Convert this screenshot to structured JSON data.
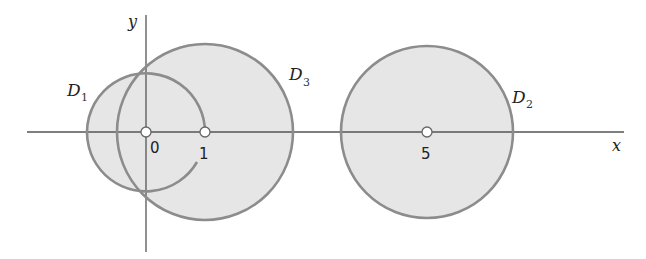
{
  "figure": {
    "axes": {
      "x_label": "x",
      "y_label": "y",
      "stroke_color": "#555555"
    },
    "regions": [
      {
        "id": "D1",
        "label_main": "D",
        "label_sub": "1",
        "center": 0,
        "radius": 1,
        "boundary": "open arc (partial circle)"
      },
      {
        "id": "D3",
        "label_main": "D",
        "label_sub": "3",
        "center": 1,
        "radius": 1.5,
        "boundary": "full circle"
      },
      {
        "id": "D2",
        "label_main": "D",
        "label_sub": "2",
        "center": 5,
        "radius": 1.5,
        "boundary": "full circle"
      }
    ],
    "points": [
      {
        "label": "0",
        "x": 0
      },
      {
        "label": "1",
        "x": 1
      },
      {
        "label": "5",
        "x": 5
      }
    ],
    "colors": {
      "fill": "#e6e6e6",
      "stroke": "#8c8c8c",
      "point_fill": "#ffffff"
    }
  }
}
